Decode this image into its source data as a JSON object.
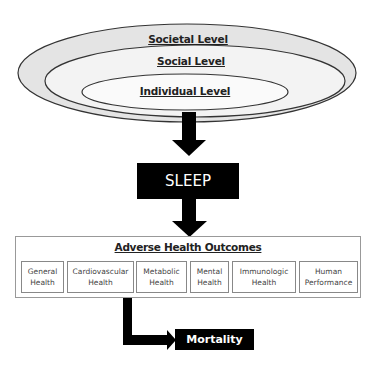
{
  "levels": {
    "societal": "Societal Level",
    "social": "Social Level",
    "individual": "Individual  Level"
  },
  "sleep": "SLEEP",
  "outcomes": {
    "title": "Adverse Health Outcomes",
    "items": [
      {
        "line1": "General",
        "line2": "Health"
      },
      {
        "line1": "Cardiovascular",
        "line2": "Health"
      },
      {
        "line1": "Metabolic",
        "line2": "Health"
      },
      {
        "line1": "Mental",
        "line2": "Health"
      },
      {
        "line1": "Immunologic",
        "line2": "Health"
      },
      {
        "line1": "Human",
        "line2": "Performance"
      }
    ]
  },
  "mortality": "Mortality",
  "colors": {
    "ring_fill": "#e4e4e4",
    "inner_fill": "#f7f7f7",
    "stroke": "#333333",
    "box_fill": "#000000"
  }
}
